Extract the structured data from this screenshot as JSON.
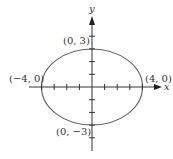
{
  "diagram": {
    "type": "ellipse-graph",
    "equation_params": {
      "a": 4,
      "b": 3,
      "center": [
        0,
        0
      ]
    },
    "axes": {
      "x_label": "x",
      "y_label": "y"
    },
    "points": [
      {
        "name": "top-vertex",
        "label": "(0, 3)",
        "x": 0,
        "y": 3
      },
      {
        "name": "left-vertex",
        "label": "(−4, 0)",
        "x": -4,
        "y": 0
      },
      {
        "name": "right-vertex",
        "label": "(4, 0)",
        "x": 4,
        "y": 0
      },
      {
        "name": "bottom-vertex",
        "label": "(0, −3)",
        "x": 0,
        "y": -3
      }
    ],
    "ticks": {
      "x": [
        -4,
        -3,
        -2,
        -1,
        1,
        2,
        3,
        4
      ],
      "y": [
        -4,
        -3,
        -2,
        -1,
        1,
        2,
        3,
        4
      ]
    },
    "colors": {
      "ellipse": "#555555",
      "axes": "#333333",
      "text": "#333333"
    }
  }
}
